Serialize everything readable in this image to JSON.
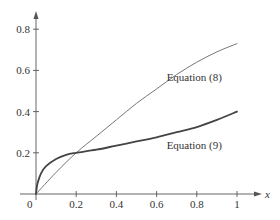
{
  "chart_data": {
    "type": "line",
    "title": "",
    "xlabel": "x",
    "ylabel": "",
    "xlim": [
      0,
      1
    ],
    "ylim": [
      0,
      0.85
    ],
    "grid": false,
    "legend": "inline labels",
    "x_ticks": [
      0.2,
      0.4,
      0.6,
      0.8,
      1
    ],
    "x_tick_labels": [
      "0.2",
      "0.4",
      "0.6",
      "0.8",
      "1"
    ],
    "y_ticks": [
      0.2,
      0.4,
      0.6,
      0.8
    ],
    "y_tick_labels": [
      "0.2",
      "0.4",
      "0.6",
      "0.8"
    ],
    "origin_label": "0",
    "series": [
      {
        "name": "Equation (8)",
        "color": "#666666",
        "stroke_width": 0.9,
        "label_pos": [
          0.65,
          0.55
        ],
        "x": [
          0,
          0.1,
          0.2,
          0.3,
          0.4,
          0.5,
          0.6,
          0.7,
          0.8,
          0.9,
          1.0
        ],
        "y": [
          0,
          0.105,
          0.2,
          0.28,
          0.36,
          0.44,
          0.51,
          0.58,
          0.64,
          0.69,
          0.73
        ]
      },
      {
        "name": "Equation (9)",
        "color": "#444444",
        "stroke_width": 1.8,
        "label_pos": [
          0.65,
          0.22
        ],
        "x": [
          0,
          0.005,
          0.01,
          0.025,
          0.05,
          0.1,
          0.15,
          0.2,
          0.3,
          0.4,
          0.5,
          0.6,
          0.7,
          0.8,
          0.9,
          1.0
        ],
        "y": [
          0,
          0.04,
          0.06,
          0.1,
          0.135,
          0.17,
          0.19,
          0.2,
          0.215,
          0.235,
          0.255,
          0.275,
          0.3,
          0.325,
          0.36,
          0.4
        ]
      }
    ]
  }
}
